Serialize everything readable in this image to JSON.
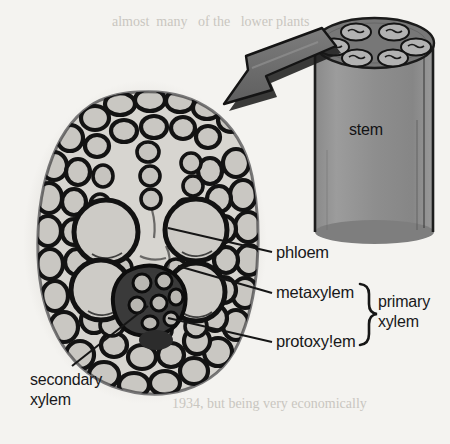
{
  "figure": {
    "background_color": "#f4f3f0",
    "ink_color": "#18181a"
  },
  "stem": {
    "label": "stem",
    "bundle_count": 6,
    "body_color": "#8e8e8e",
    "top_color": "#7b7b7b",
    "bundle_color": "#b0b0b0"
  },
  "arrow": {
    "name": "magnification-arrow",
    "direction": "down-left",
    "color": "#6f6f6f",
    "shadow_color": "#1b1b1b"
  },
  "cross_section": {
    "name": "vascular-bundle-micrograph",
    "cell_fill": "#c9c7c2",
    "wall_color": "#141414",
    "halo_color": "#dedcd7",
    "metaxylem_vessel_count": 4
  },
  "labels": {
    "phloem": "phloem",
    "metaxylem": "metaxylem",
    "protoxylem": "protoxy!em",
    "primary_xylem": "primary\nxylem",
    "secondary_xylem": "secondary\nxylem"
  },
  "bracket": {
    "name": "primary-xylem-brace",
    "glyph": "}",
    "groups": [
      "metaxylem",
      "protoxy!em"
    ]
  },
  "scan_bleed": {
    "top_line": "almost  many   of the   lower plants",
    "bottom_line": "1934, but being very economically"
  }
}
